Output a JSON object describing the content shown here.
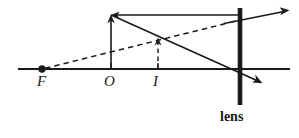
{
  "figure": {
    "type": "optics-ray-diagram",
    "background_color": "#ffffff",
    "stroke_color": "#1a1a1a",
    "width": 299,
    "height": 138
  },
  "labels": {
    "focal_point": "F",
    "object": "O",
    "image": "I",
    "lens": "lens"
  },
  "geometry": {
    "optical_axis": {
      "x1": 18,
      "y1": 69,
      "x2": 290,
      "y2": 69
    },
    "focal_point": {
      "x": 42,
      "y": 69,
      "dot_radius": 3.6
    },
    "object": {
      "base_x": 111,
      "base_y": 69,
      "tip_x": 111,
      "tip_y": 15,
      "style": "solid",
      "arrow": "up"
    },
    "image": {
      "base_x": 158,
      "base_y": 69,
      "tip_x": 158,
      "tip_y": 38,
      "style": "dashed",
      "arrow": "up"
    },
    "lens": {
      "x": 240,
      "y_top": 8,
      "y_bottom": 105,
      "thickness": 4.5
    },
    "rays": [
      {
        "name": "parallel-ray-incident",
        "style": "solid",
        "from": {
          "x": 240,
          "y": 15
        },
        "to": {
          "x": 111,
          "y": 15
        },
        "arrow_at": "to"
      },
      {
        "name": "parallel-ray-refracted",
        "style": "solid",
        "from": {
          "x": 111,
          "y": 15
        },
        "to": {
          "x": 261,
          "y": 83
        },
        "arrow_at": "to"
      },
      {
        "name": "focal-ray-virtual-extension",
        "style": "dashed",
        "from": {
          "x": 42,
          "y": 69
        },
        "to": {
          "x": 240,
          "y": 20
        },
        "arrow_at": "none"
      },
      {
        "name": "focal-ray-refracted",
        "style": "solid",
        "from": {
          "x": 226,
          "y": 23
        },
        "to": {
          "x": 288,
          "y": 10
        },
        "arrow_at": "to"
      }
    ],
    "axis_ticks": [
      {
        "name": "tick-object",
        "x": 111,
        "y_top": 63,
        "y_bottom": 69
      },
      {
        "name": "tick-image",
        "x": 158,
        "y_top": 63,
        "y_bottom": 69
      }
    ],
    "label_positions": {
      "focal_point": {
        "x": 38,
        "y": 74
      },
      "object": {
        "x": 105,
        "y": 74
      },
      "image": {
        "x": 152,
        "y": 74
      },
      "lens": {
        "x": 221,
        "y": 110
      }
    }
  }
}
